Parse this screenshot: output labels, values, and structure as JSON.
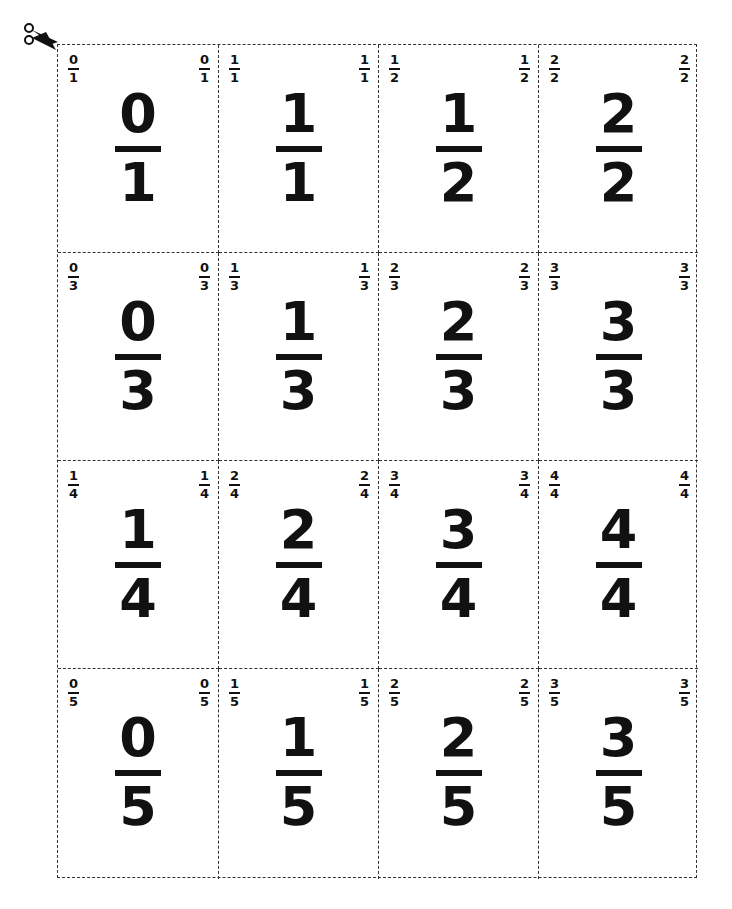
{
  "page": {
    "icon": "scissors-icon"
  },
  "cards": [
    {
      "n": "0",
      "d": "1"
    },
    {
      "n": "1",
      "d": "1"
    },
    {
      "n": "1",
      "d": "2"
    },
    {
      "n": "2",
      "d": "2"
    },
    {
      "n": "0",
      "d": "3"
    },
    {
      "n": "1",
      "d": "3"
    },
    {
      "n": "2",
      "d": "3"
    },
    {
      "n": "3",
      "d": "3"
    },
    {
      "n": "1",
      "d": "4"
    },
    {
      "n": "2",
      "d": "4"
    },
    {
      "n": "3",
      "d": "4"
    },
    {
      "n": "4",
      "d": "4"
    },
    {
      "n": "0",
      "d": "5"
    },
    {
      "n": "1",
      "d": "5"
    },
    {
      "n": "2",
      "d": "5"
    },
    {
      "n": "3",
      "d": "5"
    }
  ]
}
